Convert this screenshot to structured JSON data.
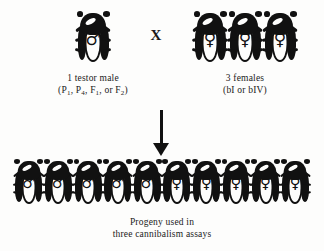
{
  "figure": {
    "type": "breeding-cross-diagram",
    "background_color": "#fdfdfc",
    "ink_color": "#111111"
  },
  "cross": {
    "operator": "X",
    "operator_name": "cross-symbol"
  },
  "male_parent": {
    "count": 1,
    "sex": "male",
    "sex_symbol": "♂",
    "beetle_icon": "beetle-male-icon",
    "label_line1": "1 testor male",
    "label_line2_open": "(P",
    "genotypes": [
      {
        "letter": "P",
        "sub": "1",
        "sep": ", "
      },
      {
        "letter": "P",
        "sub": "4",
        "sep": ", "
      },
      {
        "letter": "F",
        "sub": "1",
        "sep": ", or "
      },
      {
        "letter": "F",
        "sub": "2",
        "sep": ")"
      }
    ]
  },
  "female_parents": {
    "count": 3,
    "sex": "female",
    "sex_symbol": "♀",
    "beetle_icon": "beetle-female-icon",
    "label_line1": "3 females",
    "label_line2": "(bI or bIV)",
    "strains": [
      "bI",
      "bIV"
    ]
  },
  "arrow": {
    "direction": "down",
    "name": "down-arrow"
  },
  "progeny": {
    "total": 10,
    "males": 5,
    "females": 5,
    "sequence": [
      "male",
      "male",
      "male",
      "male",
      "male",
      "female",
      "female",
      "female",
      "female",
      "female"
    ],
    "male_symbol": "♂",
    "female_symbol": "♀",
    "caption_line1": "Progeny used in",
    "caption_line2": "three  cannibalism  assays"
  }
}
